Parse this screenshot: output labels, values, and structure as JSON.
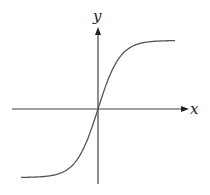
{
  "chart_data": {
    "type": "line",
    "title": "",
    "xlabel": "x",
    "ylabel": "y",
    "function": "y = tanh(x)",
    "grid": false,
    "legend": null,
    "x": [
      -3,
      -2.5,
      -2,
      -1.5,
      -1,
      -0.5,
      0,
      0.5,
      1,
      1.5,
      2,
      2.5,
      3
    ],
    "series": [
      {
        "name": "curve",
        "values": [
          -0.995,
          -0.987,
          -0.964,
          -0.905,
          -0.762,
          -0.462,
          0,
          0.462,
          0.762,
          0.905,
          0.964,
          0.987,
          0.995
        ]
      }
    ],
    "xlim": [
      -3.2,
      3.2
    ],
    "ylim": [
      -1.2,
      1.2
    ]
  },
  "axes": {
    "x_label": "x",
    "y_label": "y"
  },
  "colors": {
    "stroke": "#555555",
    "axis": "#333333",
    "background": "#ffffff"
  }
}
